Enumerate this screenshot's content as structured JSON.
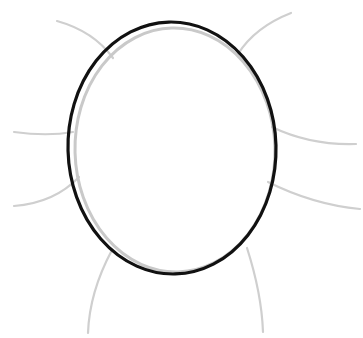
{
  "artwork": {
    "title": "Head Oval Outline Drawing Step",
    "description": "Line-art drawing step showing a dark inked oval head shape traced over a faint gray under-sketch oval, with six light gray construction guide curves radiating outward.",
    "canvas": {
      "width": 363,
      "height": 338,
      "background_color": "#ffffff"
    },
    "palette": {
      "ink_black": "#111111",
      "sketch_gray": "#c9c9c9",
      "guide_gray": "#cfcfcf",
      "background": "#ffffff"
    },
    "strokes": {
      "ink_oval": {
        "name": "head-outline-oval",
        "color": "#111111",
        "width": 3.2,
        "center_x": 172,
        "center_y": 148,
        "radius_x": 104,
        "radius_y": 126,
        "rotation_deg": -1.5
      },
      "sketch_oval": {
        "name": "under-sketch-oval",
        "color": "#c9c9c9",
        "width": 3.0,
        "center_x": 175,
        "center_y": 150,
        "radius_x": 100,
        "radius_y": 122,
        "rotation_deg": -1.5
      }
    },
    "guides": [
      {
        "name": "guide-top-left-diagonal",
        "label": "Top left diagonal guide",
        "color": "#cfcfcf",
        "width": 2.2,
        "path": "M 57 21 C 82 28 100 40 113 58"
      },
      {
        "name": "guide-top-right-diagonal",
        "label": "Top right diagonal guide",
        "color": "#cfcfcf",
        "width": 2.2,
        "path": "M 291 13 C 268 22 250 35 238 54"
      },
      {
        "name": "guide-left-horizontal",
        "label": "Left horizontal brow guide",
        "color": "#cfcfcf",
        "width": 2.2,
        "path": "M 14 132 C 36 135 56 135 73 132"
      },
      {
        "name": "guide-right-horizontal",
        "label": "Right horizontal brow guide",
        "color": "#cfcfcf",
        "width": 2.2,
        "path": "M 272 127 C 297 139 326 145 356 144"
      },
      {
        "name": "guide-lower-left-sweep",
        "label": "Lower left jaw sweep guide",
        "color": "#cfcfcf",
        "width": 2.2,
        "path": "M 14 206 C 40 204 62 195 79 177"
      },
      {
        "name": "guide-lower-right-sweep",
        "label": "Lower right jaw sweep guide",
        "color": "#cfcfcf",
        "width": 2.2,
        "path": "M 268 182 C 296 196 328 206 360 209"
      },
      {
        "name": "guide-bottom-left-neck",
        "label": "Bottom left neck guide",
        "color": "#cfcfcf",
        "width": 2.2,
        "path": "M 112 250 C 97 278 89 305 88 333"
      },
      {
        "name": "guide-bottom-right-neck",
        "label": "Bottom right neck guide",
        "color": "#cfcfcf",
        "width": 2.2,
        "path": "M 247 248 C 256 276 262 304 263 332"
      }
    ]
  }
}
